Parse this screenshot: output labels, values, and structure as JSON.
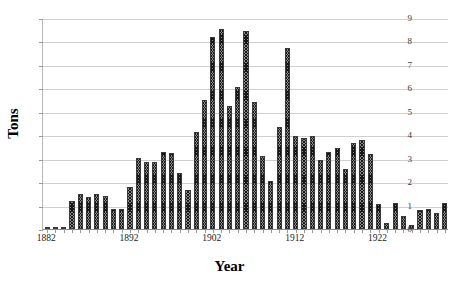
{
  "chart_data": {
    "type": "bar",
    "title": "",
    "xlabel": "Year",
    "ylabel": "Tons",
    "ylim": [
      0,
      9
    ],
    "ytick_values": [
      0,
      1,
      2,
      3,
      4,
      5,
      6,
      7,
      8,
      9
    ],
    "ytick_labels": [
      "0",
      "1",
      "2",
      "3",
      "4",
      "5",
      "6",
      "7",
      "8",
      "9"
    ],
    "xtick_labels": [
      "1882",
      "1892",
      "1902",
      "1912",
      "1922"
    ],
    "xtick_years": [
      1882,
      1892,
      1902,
      1912,
      1922
    ],
    "grid": true,
    "legend": "none",
    "bar_fill": "diagonal-crosshatch",
    "bar_color": "#8c8c8c",
    "categories": [
      1882,
      1883,
      1884,
      1885,
      1886,
      1887,
      1888,
      1889,
      1890,
      1891,
      1892,
      1893,
      1894,
      1895,
      1896,
      1897,
      1898,
      1899,
      1900,
      1901,
      1902,
      1903,
      1904,
      1905,
      1906,
      1907,
      1908,
      1909,
      1910,
      1911,
      1912,
      1913,
      1914,
      1915,
      1916,
      1917,
      1918,
      1919,
      1920,
      1921,
      1922,
      1923,
      1924,
      1925,
      1926,
      1927,
      1928,
      1929,
      1930
    ],
    "values": [
      0.05,
      0.04,
      0.06,
      1.2,
      1.5,
      1.35,
      1.5,
      1.4,
      0.85,
      0.85,
      1.8,
      3.05,
      2.85,
      2.85,
      3.3,
      3.25,
      2.4,
      1.65,
      4.15,
      5.5,
      8.2,
      8.55,
      5.25,
      6.05,
      8.45,
      5.4,
      3.1,
      2.05,
      4.35,
      7.7,
      3.95,
      3.9,
      3.95,
      2.95,
      3.3,
      3.45,
      2.55,
      3.65,
      3.8,
      3.2,
      1.05,
      0.25,
      1.1,
      0.55,
      0.15,
      0.8,
      0.85,
      0.7,
      1.1
    ]
  }
}
